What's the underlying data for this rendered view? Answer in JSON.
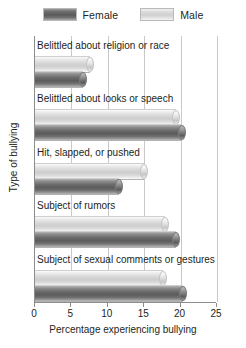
{
  "chart_data": {
    "type": "bar",
    "orientation": "horizontal",
    "title": "",
    "xlabel": "Percentage experiencing bullying",
    "ylabel": "Type of bullying",
    "xlim": [
      0,
      25
    ],
    "xticks": [
      0,
      5,
      10,
      15,
      20,
      25
    ],
    "grid": true,
    "legend_position": "top-center",
    "categories": [
      "Belittled about religion or race",
      "Belittled about looks or speech",
      "Hit, slapped, or pushed",
      "Subject of rumors",
      "Subject of sexual comments or gestures"
    ],
    "series": [
      {
        "name": "Female",
        "color": "#5c5c5c",
        "values": [
          6.6,
          20.2,
          11.6,
          19.3,
          20.3
        ]
      },
      {
        "name": "Male",
        "color": "#cdcdcd",
        "values": [
          7.5,
          19.4,
          15.0,
          17.8,
          17.6
        ]
      }
    ]
  },
  "legend": {
    "entries": [
      {
        "label": "Female",
        "swatch": "female-swatch"
      },
      {
        "label": "Male",
        "swatch": "male-swatch"
      }
    ]
  },
  "axis": {
    "x_title": "Percentage experiencing bullying",
    "y_title": "Type of bullying",
    "x_tick_labels": [
      "0",
      "5",
      "10",
      "15",
      "20",
      "25"
    ]
  }
}
